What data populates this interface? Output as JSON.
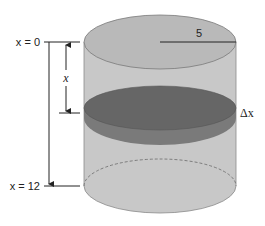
{
  "diagram": {
    "labels": {
      "top": "x = 0",
      "bottom": "x = 12",
      "depth": "x",
      "radius": "5",
      "thickness": "Δx"
    },
    "colors": {
      "cylinder_body": "#c4c4c4",
      "cylinder_top": "#b8b8b8",
      "slice_top": "#6a6a6a",
      "slice_side": "#7c7c7c",
      "outline": "#5a5a5a",
      "lines": "#222222"
    },
    "geometry": {
      "cx": 160,
      "rx": 76,
      "ry": 27,
      "top_y": 42,
      "bottom_y": 186,
      "slice_top_y": 108,
      "slice_bottom_y": 118
    }
  }
}
